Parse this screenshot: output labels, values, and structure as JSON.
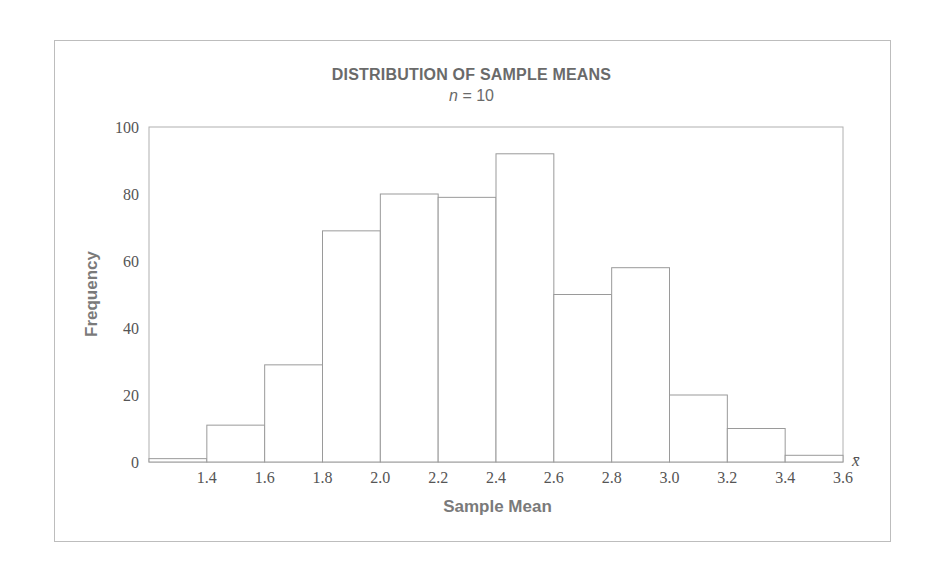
{
  "chart_data": {
    "type": "bar",
    "subtype": "histogram",
    "title": "DISTRIBUTION OF SAMPLE MEANS",
    "subtitle": "n = 10",
    "subtitle_var": "n",
    "subtitle_value": "= 10",
    "xlabel": "Sample Mean",
    "ylabel": "Frequency",
    "x_axis_symbol": "x̄",
    "bin_edges": [
      1.2,
      1.4,
      1.6,
      1.8,
      2.0,
      2.2,
      2.4,
      2.6,
      2.8,
      3.0,
      3.2,
      3.4,
      3.6
    ],
    "categories": [
      "1.2–1.4",
      "1.4–1.6",
      "1.6–1.8",
      "1.8–2.0",
      "2.0–2.2",
      "2.2–2.4",
      "2.4–2.6",
      "2.6–2.8",
      "2.8–3.0",
      "3.0–3.2",
      "3.2–3.4",
      "3.4–3.6"
    ],
    "values": [
      1,
      11,
      29,
      69,
      80,
      79,
      92,
      50,
      58,
      20,
      10,
      2
    ],
    "xlim": [
      1.2,
      3.6
    ],
    "ylim": [
      0,
      100
    ],
    "x_ticks": [
      "1.4",
      "1.6",
      "1.8",
      "2.0",
      "2.2",
      "2.4",
      "2.6",
      "2.8",
      "3.0",
      "3.2",
      "3.4",
      "3.6"
    ],
    "y_ticks": [
      "0",
      "20",
      "40",
      "60",
      "80",
      "100"
    ],
    "grid": false,
    "legend": null,
    "colors": {
      "bar_fill": "#ffffff",
      "bar_edge": "#9a9a9a",
      "text": "#6a6a6a"
    }
  }
}
